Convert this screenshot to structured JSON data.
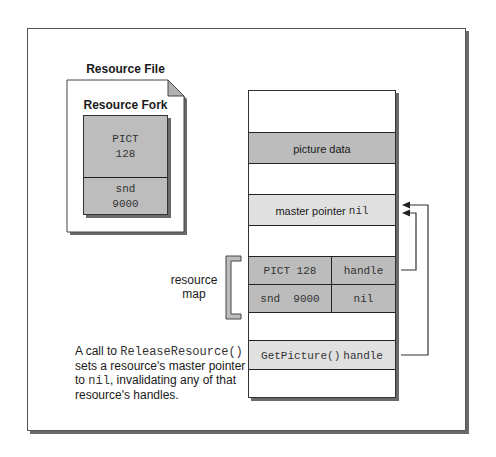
{
  "resource_file": {
    "title": "Resource File",
    "fork_title": "Resource Fork",
    "entries": [
      {
        "type": "PICT",
        "id": "128"
      },
      {
        "type": "snd",
        "id": "9000"
      }
    ]
  },
  "memory": {
    "picture_data": "picture data",
    "master_pointer_label": "master pointer",
    "master_pointer_value": "nil",
    "resource_map": [
      {
        "resource": "PICT 128",
        "value": "handle"
      },
      {
        "resource": "snd  9000",
        "value": "nil"
      }
    ],
    "getpicture_call": "GetPicture()",
    "getpicture_value": "handle"
  },
  "resource_map_label": [
    "resource",
    "map"
  ],
  "caption": {
    "prefix": "A call to ",
    "function": "ReleaseResource()",
    "line2": " sets a resource's master pointer to ",
    "nil": "nil",
    "suffix": ", invalidating any of that resource's handles."
  },
  "colors": {
    "dark_fill": "#bcbcbc",
    "light_fill": "#e0e0e0",
    "border": "#222222",
    "shadow": "#6a6a6a"
  }
}
